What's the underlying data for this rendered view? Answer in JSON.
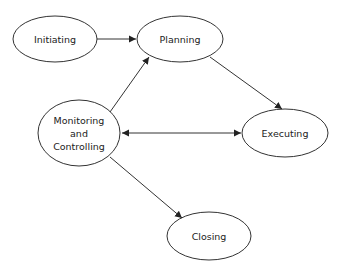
{
  "diagram": {
    "type": "process-flow",
    "colors": {
      "stroke": "#333333",
      "text": "#222222",
      "background": "#ffffff"
    },
    "nodes": [
      {
        "id": "initiating",
        "label": "Initiating",
        "cx": 55,
        "cy": 39,
        "rx": 42,
        "ry": 23
      },
      {
        "id": "planning",
        "label": "Planning",
        "cx": 180,
        "cy": 39,
        "rx": 43,
        "ry": 23
      },
      {
        "id": "monitoring",
        "label": "Monitoring\nand\nControlling",
        "cx": 79,
        "cy": 133,
        "rx": 41,
        "ry": 33
      },
      {
        "id": "executing",
        "label": "Executing",
        "cx": 285,
        "cy": 133,
        "rx": 43,
        "ry": 24
      },
      {
        "id": "closing",
        "label": "Closing",
        "cx": 209,
        "cy": 236,
        "rx": 42,
        "ry": 24
      }
    ],
    "edges": [
      {
        "from": "initiating",
        "to": "planning",
        "direction": "forward"
      },
      {
        "from": "monitoring",
        "to": "planning",
        "direction": "forward"
      },
      {
        "from": "planning",
        "to": "executing",
        "direction": "forward"
      },
      {
        "from": "monitoring",
        "to": "executing",
        "direction": "both"
      },
      {
        "from": "monitoring",
        "to": "closing",
        "direction": "forward"
      }
    ]
  }
}
